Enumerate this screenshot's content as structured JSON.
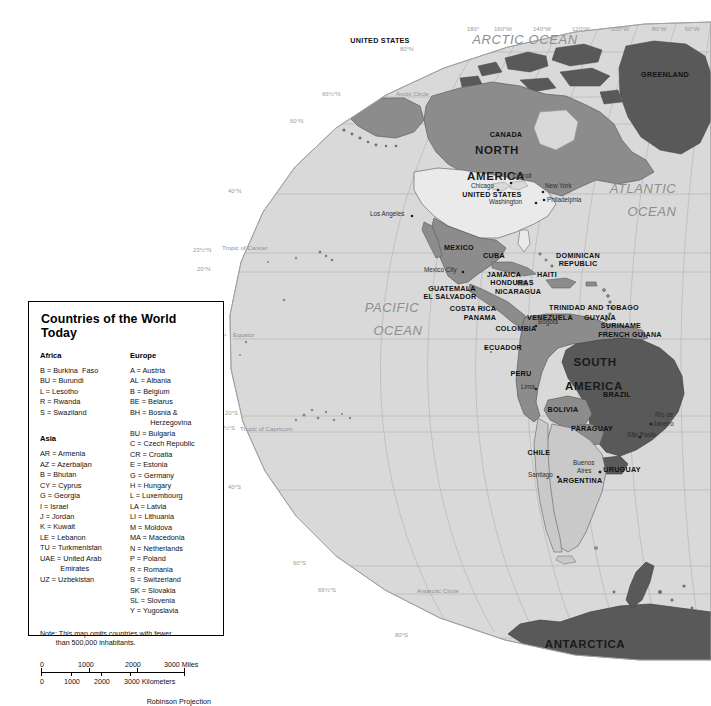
{
  "map": {
    "projection_note": "Robinson Projection",
    "ocean_labels": [
      {
        "text": "ARCTIC  OCEAN",
        "x": 525,
        "y": 44
      },
      {
        "text": "ATLANTIC",
        "x": 643,
        "y": 193
      },
      {
        "text": "OCEAN",
        "x": 652,
        "y": 216
      },
      {
        "text": "PACIFIC",
        "x": 392,
        "y": 312
      },
      {
        "text": "OCEAN",
        "x": 398,
        "y": 335
      }
    ],
    "continent_labels": [
      {
        "text": "NORTH",
        "x": 497,
        "y": 154
      },
      {
        "text": "AMERICA",
        "x": 496,
        "y": 180
      },
      {
        "text": "SOUTH",
        "x": 595,
        "y": 366
      },
      {
        "text": "AMERICA",
        "x": 594,
        "y": 390
      },
      {
        "text": "ANTARCTICA",
        "x": 585,
        "y": 648
      }
    ],
    "country_labels": [
      {
        "text": "GREENLAND",
        "x": 665,
        "y": 77
      },
      {
        "text": "CANADA",
        "x": 506,
        "y": 137
      },
      {
        "text": "UNITED STATES",
        "x": 380,
        "y": 43
      },
      {
        "text": "UNITED STATES",
        "x": 492,
        "y": 197
      },
      {
        "text": "MEXICO",
        "x": 459,
        "y": 250
      },
      {
        "text": "CUBA",
        "x": 494,
        "y": 258
      },
      {
        "text": "DOMINICAN",
        "x": 578,
        "y": 258
      },
      {
        "text": "REPUBLIC",
        "x": 578,
        "y": 266
      },
      {
        "text": "JAMAICA",
        "x": 504,
        "y": 277
      },
      {
        "text": "HAITI",
        "x": 547,
        "y": 277
      },
      {
        "text": "HONDURAS",
        "x": 512,
        "y": 285
      },
      {
        "text": "GUATEMALA",
        "x": 452,
        "y": 291
      },
      {
        "text": "EL SALVADOR",
        "x": 450,
        "y": 299
      },
      {
        "text": "NICARAGUA",
        "x": 518,
        "y": 294
      },
      {
        "text": "COSTA RICA",
        "x": 473,
        "y": 311
      },
      {
        "text": "PANAMA",
        "x": 480,
        "y": 320
      },
      {
        "text": "TRINIDAD AND TOBAGO",
        "x": 594,
        "y": 310
      },
      {
        "text": "VENEZUELA",
        "x": 550,
        "y": 320
      },
      {
        "text": "GUYANA",
        "x": 600,
        "y": 320
      },
      {
        "text": "SURINAME",
        "x": 621,
        "y": 328
      },
      {
        "text": "FRENCH GUIANA",
        "x": 630,
        "y": 337
      },
      {
        "text": "COLOMBIA",
        "x": 516,
        "y": 331
      },
      {
        "text": "ECUADOR",
        "x": 503,
        "y": 350
      },
      {
        "text": "PERU",
        "x": 521,
        "y": 376
      },
      {
        "text": "BRAZIL",
        "x": 617,
        "y": 397
      },
      {
        "text": "BOLIVIA",
        "x": 563,
        "y": 412
      },
      {
        "text": "PARAGUAY",
        "x": 592,
        "y": 431
      },
      {
        "text": "CHILE",
        "x": 539,
        "y": 455
      },
      {
        "text": "URUGUAY",
        "x": 622,
        "y": 472
      },
      {
        "text": "ARGENTINA",
        "x": 580,
        "y": 483
      }
    ],
    "city_labels": [
      {
        "text": "Chicago",
        "x": 471,
        "y": 188,
        "dot_x": 498,
        "dot_y": 190
      },
      {
        "text": "Detroit",
        "x": 513,
        "y": 178,
        "dot_x": 511,
        "dot_y": 183
      },
      {
        "text": "New York",
        "x": 545,
        "y": 188,
        "dot_x": 543,
        "dot_y": 192
      },
      {
        "text": "Philadelphia",
        "x": 547,
        "y": 202,
        "dot_x": 544,
        "dot_y": 200
      },
      {
        "text": "Washington",
        "x": 489,
        "y": 204,
        "dot_x": 536,
        "dot_y": 203
      },
      {
        "text": "Los Angeles",
        "x": 370,
        "y": 216,
        "dot_x": 412,
        "dot_y": 216
      },
      {
        "text": "Mexico City",
        "x": 424,
        "y": 272,
        "dot_x": 463,
        "dot_y": 272
      },
      {
        "text": "Bogotá",
        "x": 538,
        "y": 324,
        "dot_x": 536,
        "dot_y": 326
      },
      {
        "text": "Lima",
        "x": 521,
        "y": 389,
        "dot_x": 536,
        "dot_y": 389
      },
      {
        "text": "Rio de",
        "x": 655,
        "y": 417,
        "dot_x": 651,
        "dot_y": 424
      },
      {
        "text": "Janeiro",
        "x": 653,
        "y": 426,
        "dot_x": 651,
        "dot_y": 424
      },
      {
        "text": "São Paulo",
        "x": 627,
        "y": 437,
        "dot_x": 640,
        "dot_y": 437
      },
      {
        "text": "Buenos",
        "x": 573,
        "y": 465,
        "dot_x": 600,
        "dot_y": 472
      },
      {
        "text": "Aires",
        "x": 577,
        "y": 473,
        "dot_x": 600,
        "dot_y": 472
      },
      {
        "text": "Santiago",
        "x": 528,
        "y": 477,
        "dot_x": 558,
        "dot_y": 477
      }
    ],
    "longitude_labels": [
      {
        "text": "180°",
        "x": 473,
        "y": 31
      },
      {
        "text": "160°W",
        "x": 503,
        "y": 31
      },
      {
        "text": "140°W",
        "x": 542,
        "y": 31
      },
      {
        "text": "120°W",
        "x": 581,
        "y": 31
      },
      {
        "text": "100°W",
        "x": 620,
        "y": 31
      },
      {
        "text": "80°W",
        "x": 659,
        "y": 31
      },
      {
        "text": "60°W",
        "x": 692,
        "y": 31
      }
    ],
    "latitude_labels": [
      {
        "text": "80°N",
        "x": 400,
        "y": 51
      },
      {
        "text": "66½°N",
        "x": 322,
        "y": 96
      },
      {
        "text": "60°N",
        "x": 290,
        "y": 123
      },
      {
        "text": "40°N",
        "x": 228,
        "y": 193
      },
      {
        "text": "23½°N",
        "x": 193,
        "y": 252
      },
      {
        "text": "20°N",
        "x": 197,
        "y": 271
      },
      {
        "text": "0°",
        "x": 221,
        "y": 338
      },
      {
        "text": "20°S",
        "x": 225,
        "y": 415
      },
      {
        "text": "23½°S",
        "x": 217,
        "y": 430
      },
      {
        "text": "40°S",
        "x": 228,
        "y": 489
      },
      {
        "text": "60°S",
        "x": 293,
        "y": 565
      },
      {
        "text": "66½°S",
        "x": 318,
        "y": 592
      },
      {
        "text": "80°S",
        "x": 395,
        "y": 637
      }
    ],
    "reference_lines": [
      {
        "text": "Arctic Circle",
        "x": 396,
        "y": 96
      },
      {
        "text": "Tropic of Cancer",
        "x": 222,
        "y": 250
      },
      {
        "text": "Equator",
        "x": 233,
        "y": 337
      },
      {
        "text": "Tropic of Capricorn",
        "x": 240,
        "y": 431
      },
      {
        "text": "Antarctic Circle",
        "x": 417,
        "y": 593
      }
    ]
  },
  "legend": {
    "title": "Countries of the World Today",
    "groups": [
      {
        "heading": "Africa",
        "items": [
          "B = Burkina  Faso",
          "BU = Burundi",
          "L = Lesotho",
          "R = Rwanda",
          "S = Swaziland"
        ]
      },
      {
        "heading": "Asia",
        "items": [
          "AR = Armenia",
          "AZ = Azerbaijan",
          "B = Bhutan",
          "CY = Cyprus",
          "G = Georgia",
          "I = Israel",
          "J = Jordan",
          "K = Kuwait",
          "LE = Lebanon",
          "TU = Turkmenistan",
          "UAE = United Arab\n          Emirates",
          "UZ = Uzbekistan"
        ]
      },
      {
        "heading": "Europe",
        "items": [
          "A = Austria",
          "AL = Albania",
          "B = Belgium",
          "BE = Belarus",
          "BH = Bosnia &\n          Herzegovina",
          "BU = Bulgaria",
          "C = Czech Republic",
          "CR = Croatia",
          "E = Estonia",
          "G = Germany",
          "H = Hungary",
          "L = Luxembourg",
          "LA = Latvia",
          "LI = Lithuania",
          "M = Moldova",
          "MA = Macedonia",
          "N = Netherlands",
          "P = Poland",
          "R = Romania",
          "S = Switzerland",
          "SK = Slovakia",
          "SL = Slovenia",
          "Y = Yugoslavia"
        ]
      }
    ],
    "note": "Note: This map omits countries with fewer\n        than 500,000 inhabitants.",
    "scale": {
      "miles": {
        "labels": [
          "0",
          "1000",
          "2000",
          "3000 Miles"
        ]
      },
      "kilometers": {
        "labels": [
          "0",
          "1000",
          "2000",
          "3000 Kilometers"
        ]
      }
    },
    "projection": "Robinson Projection"
  },
  "colors": {
    "ocean": "#d9d9d9",
    "page": "#ffffff",
    "land_dark": "#595959",
    "land_mid": "#8c8c8c",
    "land_light": "#c9c9c9",
    "land_pale": "#eaeaea",
    "graticule": "#b0b0b0",
    "coast": "#6b6b6b"
  }
}
